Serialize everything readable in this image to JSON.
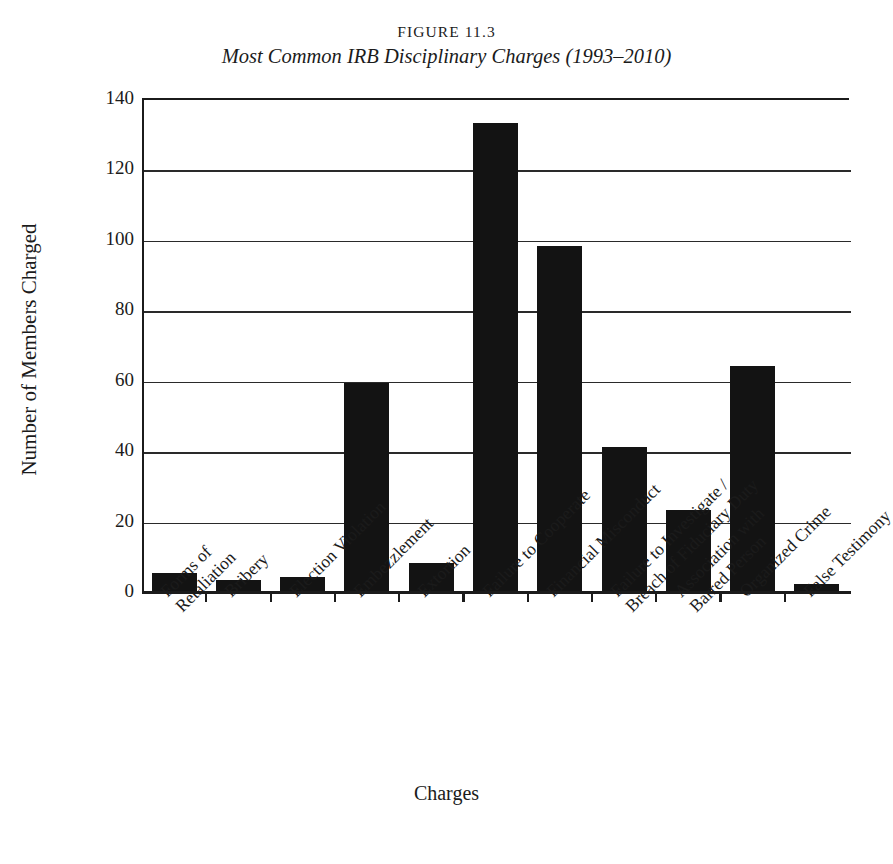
{
  "figure": {
    "number": "FIGURE 11.3",
    "title": "Most Common IRB Disciplinary Charges (1993–2010)"
  },
  "chart_data": {
    "type": "bar",
    "title": "Most Common IRB Disciplinary Charges (1993–2010)",
    "xlabel": "Charges",
    "ylabel": "Number of Members Charged",
    "ylim": [
      0,
      140
    ],
    "ytick_labels": [
      "140",
      "120",
      "100",
      "80",
      "60",
      "40",
      "20",
      "0"
    ],
    "yticks": [
      140,
      120,
      100,
      80,
      60,
      40,
      20,
      0
    ],
    "grid": true,
    "legend": "none",
    "categories": [
      "Forms of Retaliation",
      "Bribery",
      "Election Violation",
      "Embezzlement",
      "Extortion",
      "Failure to Cooperate",
      "Financial Misconduct",
      "Failure to Investigate / Breach of Fiduciary Duty",
      "Association with Barred Person",
      "Organized Crime",
      "False Testimony"
    ],
    "category_lines": [
      [
        "Forms of",
        "Retaliation"
      ],
      [
        "Bribery",
        ""
      ],
      [
        "Election Violation",
        ""
      ],
      [
        "Embezzlement",
        ""
      ],
      [
        "Extortion",
        ""
      ],
      [
        "Failure to Cooperate",
        ""
      ],
      [
        "Financial Misconduct",
        ""
      ],
      [
        "Failure to Investigate /",
        "Breach of Fiduciary Duty"
      ],
      [
        "Association with",
        "Barred Person"
      ],
      [
        "Organized Crime",
        ""
      ],
      [
        "False Testimony",
        ""
      ]
    ],
    "values": [
      5,
      3,
      4,
      59,
      8,
      133,
      98,
      41,
      23,
      64,
      2
    ],
    "bar_color": "#131313",
    "axis_color": "#1b1b1b"
  }
}
